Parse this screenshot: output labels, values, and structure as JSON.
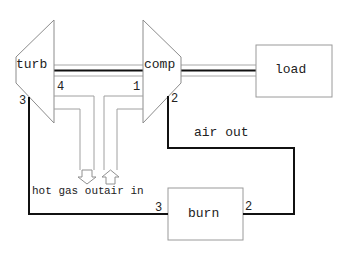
{
  "diagram": {
    "components": {
      "turbine": {
        "label": "turb"
      },
      "compressor": {
        "label": "comp"
      },
      "load": {
        "label": "load"
      },
      "burner": {
        "label": "burn"
      }
    },
    "ports": {
      "turbine_3": "3",
      "turbine_4": "4",
      "compressor_1": "1",
      "compressor_2": "2",
      "burner_3": "3",
      "burner_2": "2"
    },
    "flows": {
      "hot_gas_out": "hot gas out",
      "air_in": "air in",
      "air_out": "air out"
    },
    "colors": {
      "outline": "#a0a0a0",
      "wire": "#111111",
      "text": "#222222"
    }
  }
}
